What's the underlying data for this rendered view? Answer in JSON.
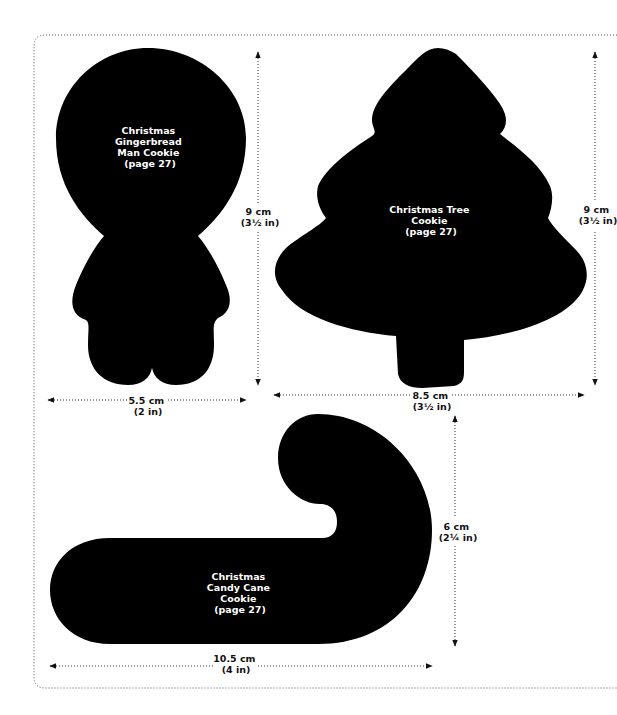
{
  "colors": {
    "background": "#ffffff",
    "shape_fill": "#000000",
    "shape_text": "#ffffff",
    "dimension_text": "#111111"
  },
  "templates": {
    "gingerbread": {
      "label_lines": [
        "Christmas",
        "Gingerbread",
        "Man Cookie",
        "(page 27)"
      ],
      "height": {
        "cm": "9 cm",
        "in": "(3½ in)"
      },
      "width": {
        "cm": "5.5 cm",
        "in": "(2 in)"
      }
    },
    "tree": {
      "label_lines": [
        "Christmas Tree",
        "Cookie",
        "(page 27)"
      ],
      "height": {
        "cm": "9 cm",
        "in": "(3½ in)"
      },
      "width": {
        "cm": "8.5 cm",
        "in": "(3½ in)"
      }
    },
    "candy_cane": {
      "label_lines": [
        "Christmas",
        "Candy Cane",
        "Cookie",
        "(page 27)"
      ],
      "height": {
        "cm": "6 cm",
        "in": "(2¼ in)"
      },
      "width": {
        "cm": "10.5 cm",
        "in": "(4 in)"
      }
    }
  }
}
